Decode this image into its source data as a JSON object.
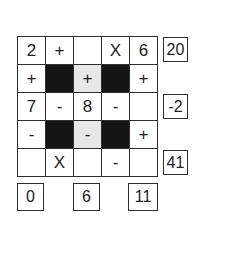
{
  "puzzle": {
    "type": "math-crossword",
    "grid": {
      "rows": [
        [
          {
            "v": "2",
            "t": "given"
          },
          {
            "v": "+",
            "t": "op"
          },
          {
            "v": "",
            "t": "empty"
          },
          {
            "v": "X",
            "t": "op"
          },
          {
            "v": "6",
            "t": "given"
          }
        ],
        [
          {
            "v": "+",
            "t": "op"
          },
          {
            "v": "",
            "t": "black"
          },
          {
            "v": "+",
            "t": "op",
            "bg": "gray"
          },
          {
            "v": "",
            "t": "black"
          },
          {
            "v": "+",
            "t": "op"
          }
        ],
        [
          {
            "v": "7",
            "t": "given"
          },
          {
            "v": "-",
            "t": "op"
          },
          {
            "v": "8",
            "t": "given"
          },
          {
            "v": "-",
            "t": "op"
          },
          {
            "v": "",
            "t": "empty"
          }
        ],
        [
          {
            "v": "-",
            "t": "op"
          },
          {
            "v": "",
            "t": "black"
          },
          {
            "v": "-",
            "t": "op",
            "bg": "gray"
          },
          {
            "v": "",
            "t": "black"
          },
          {
            "v": "+",
            "t": "op"
          }
        ],
        [
          {
            "v": "",
            "t": "empty"
          },
          {
            "v": "X",
            "t": "op"
          },
          {
            "v": "",
            "t": "empty"
          },
          {
            "v": "-",
            "t": "op"
          },
          {
            "v": "",
            "t": "empty"
          }
        ]
      ]
    },
    "row_results": [
      "20",
      "-2",
      "41"
    ],
    "column_results": [
      "0",
      "6",
      "11"
    ],
    "colors": {
      "background": "#ffffff",
      "border": "#2e2e2e",
      "black_cell": "#141414",
      "gray_cell": "#e7e7e7",
      "text": "#1d1d1d"
    }
  }
}
